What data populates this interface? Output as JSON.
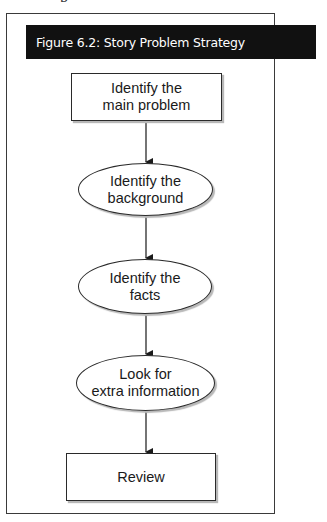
{
  "figure": {
    "title": "Figure 6.2: Story Problem Strategy",
    "top_fragment": "p"
  },
  "flowchart": {
    "nodes": [
      {
        "id": "n1",
        "shape": "rectangle",
        "line1": "Identify the",
        "line2": "main problem"
      },
      {
        "id": "n2",
        "shape": "ellipse",
        "line1": "Identify the",
        "line2": "background"
      },
      {
        "id": "n3",
        "shape": "ellipse",
        "line1": "Identify the",
        "line2": "facts"
      },
      {
        "id": "n4",
        "shape": "ellipse",
        "line1": "Look for",
        "line2": "extra information"
      },
      {
        "id": "n5",
        "shape": "rectangle",
        "line1": "Review",
        "line2": ""
      }
    ],
    "edges": [
      {
        "from": "n1",
        "to": "n2"
      },
      {
        "from": "n2",
        "to": "n3"
      },
      {
        "from": "n3",
        "to": "n4"
      },
      {
        "from": "n4",
        "to": "n5"
      }
    ]
  },
  "colors": {
    "title_bar_bg": "#111111",
    "title_text": "#ffffff",
    "line": "#2a2a2a"
  }
}
